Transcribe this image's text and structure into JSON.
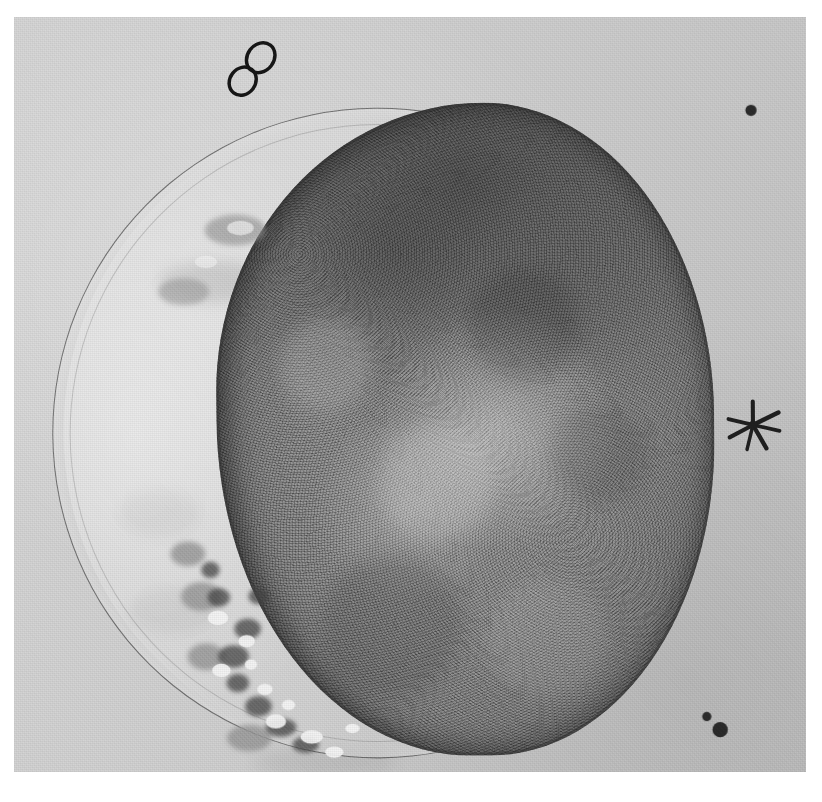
{
  "plate": {
    "kind": "scanned-halftone-micrograph",
    "title": "Photomicrograph of a spherical cell / early embryo within its membrane",
    "canvas_width": 822,
    "canvas_height": 802,
    "margin_color": "#ffffff",
    "print_color": "#cfcfcf"
  },
  "photo": {
    "left": 14,
    "top": 17,
    "width": 792,
    "height": 755,
    "background_tone": "#d0d0d0",
    "rotation_deg": -0.45,
    "description": "Light grey grainy halftone field containing a large dark granular spherical body surrounded by a thin circular membrane outline."
  },
  "specimen": {
    "zona": {
      "name": "zona pellucida",
      "stroke_color": "#343434",
      "outer": {
        "left": 45,
        "top": 96,
        "width": 636,
        "height": 636
      },
      "inner": {
        "left": 62,
        "top": 112,
        "width": 602,
        "height": 604
      }
    },
    "cell_mass": {
      "name": "granular cell mass",
      "left": 206,
      "top": 92,
      "width": 488,
      "height": 640,
      "tone_dark": "#5f5f5f",
      "tone_mid": "#7e7e7e",
      "tone_light": "#b4b4b4",
      "notes": "Darkest along the upper pole; mottled lighter patches toward the centre and lower centre; flattened and ragged along the left / lower-left border."
    },
    "perivitelline_space": {
      "name": "bright crescent between membrane and cell mass",
      "side": "left",
      "tone": "#e4e4e4"
    }
  },
  "annotations": {
    "figure_eight": {
      "label": "figure-eight ink mark",
      "x": 212,
      "y": 24,
      "w": 62,
      "h": 68,
      "ink_color": "#1a1a1a",
      "rotation_deg": 38
    },
    "asterisk": {
      "label": "asterisk ink mark",
      "x": 700,
      "y": 378,
      "w": 64,
      "h": 64,
      "ink_color": "#1f1f1f",
      "ray_count": 7
    },
    "dots": [
      {
        "label": "ink dot upper right",
        "x": 727,
        "y": 96,
        "d": 11
      },
      {
        "label": "ink dot lower right small",
        "x": 680,
        "y": 691,
        "d": 9
      },
      {
        "label": "ink dot lower right large",
        "x": 690,
        "y": 701,
        "d": 15
      }
    ]
  },
  "fragments": {
    "label": "ragged cytoplasmic fragments along the lower-left border",
    "dark": [
      {
        "x": 222,
        "y": 596,
        "w": 26,
        "h": 20
      },
      {
        "x": 206,
        "y": 622,
        "w": 30,
        "h": 22
      },
      {
        "x": 214,
        "y": 650,
        "w": 22,
        "h": 18
      },
      {
        "x": 232,
        "y": 672,
        "w": 26,
        "h": 20
      },
      {
        "x": 252,
        "y": 694,
        "w": 30,
        "h": 18
      },
      {
        "x": 278,
        "y": 712,
        "w": 26,
        "h": 16
      },
      {
        "x": 196,
        "y": 566,
        "w": 22,
        "h": 18
      },
      {
        "x": 190,
        "y": 540,
        "w": 18,
        "h": 16
      },
      {
        "x": 236,
        "y": 566,
        "w": 20,
        "h": 16
      }
    ],
    "light": [
      {
        "x": 196,
        "y": 588,
        "w": 20,
        "h": 14
      },
      {
        "x": 226,
        "y": 612,
        "w": 16,
        "h": 12
      },
      {
        "x": 200,
        "y": 640,
        "w": 18,
        "h": 13
      },
      {
        "x": 244,
        "y": 660,
        "w": 15,
        "h": 11
      },
      {
        "x": 252,
        "y": 690,
        "w": 20,
        "h": 14
      },
      {
        "x": 286,
        "y": 706,
        "w": 22,
        "h": 13
      },
      {
        "x": 310,
        "y": 722,
        "w": 18,
        "h": 11
      },
      {
        "x": 232,
        "y": 636,
        "w": 12,
        "h": 10
      },
      {
        "x": 268,
        "y": 676,
        "w": 13,
        "h": 10
      },
      {
        "x": 330,
        "y": 700,
        "w": 14,
        "h": 9
      },
      {
        "x": 218,
        "y": 206,
        "w": 26,
        "h": 14
      },
      {
        "x": 186,
        "y": 240,
        "w": 22,
        "h": 12
      }
    ],
    "mid": [
      {
        "x": 170,
        "y": 560,
        "w": 40,
        "h": 28
      },
      {
        "x": 176,
        "y": 620,
        "w": 36,
        "h": 26
      },
      {
        "x": 214,
        "y": 700,
        "w": 44,
        "h": 26
      },
      {
        "x": 160,
        "y": 520,
        "w": 34,
        "h": 24
      },
      {
        "x": 196,
        "y": 200,
        "w": 60,
        "h": 30
      },
      {
        "x": 150,
        "y": 262,
        "w": 50,
        "h": 26
      }
    ]
  },
  "smudges": [
    {
      "label": "faint background smudge upper left",
      "x": 150,
      "y": 246,
      "w": 110,
      "h": 40
    },
    {
      "label": "faint background smudge mid left",
      "x": 110,
      "y": 470,
      "w": 80,
      "h": 46
    },
    {
      "label": "faint background smudge lower left",
      "x": 118,
      "y": 566,
      "w": 90,
      "h": 44
    },
    {
      "label": "faint background smudge lower centre",
      "x": 240,
      "y": 724,
      "w": 140,
      "h": 28
    }
  ]
}
